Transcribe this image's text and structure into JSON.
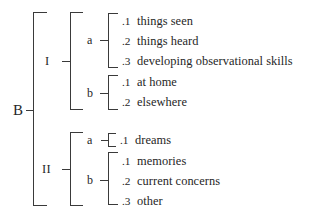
{
  "diagram": {
    "ink_color": "#3a3a3a",
    "text_color": "#262626",
    "background": "#ffffff",
    "root": {
      "label": "B"
    },
    "branches": [
      {
        "label": "I",
        "groups": [
          {
            "label": "a",
            "items": [
              {
                "num": ".1",
                "text": "things seen"
              },
              {
                "num": ".2",
                "text": "things heard"
              },
              {
                "num": ".3",
                "text": "developing observational skills"
              }
            ]
          },
          {
            "label": "b",
            "items": [
              {
                "num": ".1",
                "text": "at home"
              },
              {
                "num": ".2",
                "text": "elsewhere"
              }
            ]
          }
        ]
      },
      {
        "label": "II",
        "groups": [
          {
            "label": "a",
            "items": [
              {
                "num": ".1",
                "text": "dreams"
              }
            ]
          },
          {
            "label": "b",
            "items": [
              {
                "num": ".1",
                "text": "memories"
              },
              {
                "num": ".2",
                "text": "current concerns"
              },
              {
                "num": ".3",
                "text": "other"
              }
            ]
          }
        ]
      }
    ]
  }
}
